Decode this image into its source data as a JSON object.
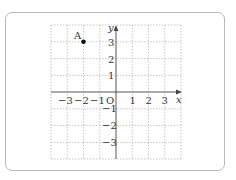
{
  "diagram": {
    "type": "coordinate-plane",
    "x_axis": {
      "label": "x",
      "ticks": [
        "-3",
        "-2",
        "-1",
        "1",
        "2",
        "3"
      ],
      "range": [
        -4,
        4
      ]
    },
    "y_axis": {
      "label": "y",
      "ticks": [
        "3",
        "2",
        "1",
        "-1",
        "-2",
        "-3"
      ],
      "range": [
        -4,
        4
      ]
    },
    "origin_label": "O",
    "points": [
      {
        "name": "A",
        "x": -2,
        "y": 3
      }
    ],
    "colors": {
      "grid": "#b0b0b0",
      "axis": "#444444",
      "frame": "#b9b9b9",
      "point": "#111111"
    }
  },
  "labels": {
    "x_axis": "x",
    "y_axis": "y",
    "origin": "O",
    "point_a": "A",
    "x_neg3": "−3",
    "x_neg2": "−2",
    "x_neg1": "−1",
    "x_1": "1",
    "x_2": "2",
    "x_3": "3",
    "y_3": "3",
    "y_2": "2",
    "y_1": "1",
    "y_neg1": "−1",
    "y_neg2": "−2",
    "y_neg3": "−3"
  }
}
